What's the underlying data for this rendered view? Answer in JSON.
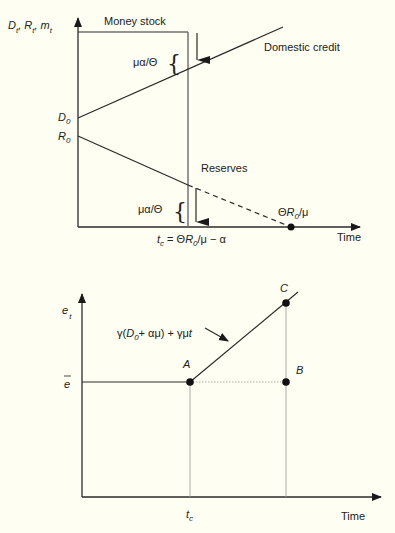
{
  "top_chart": {
    "y_axis_label": {
      "D": "D",
      "t1": "t",
      "R": "R",
      "t2": "t",
      "m": "m",
      "t3": "t",
      "sep": ","
    },
    "money_stock_label": "Money stock",
    "domestic_credit_label": "Domestic credit",
    "reserves_label": "Reserves",
    "jump_label_upper": "μα/Θ",
    "jump_label_lower": "μα/Θ",
    "d0_label": {
      "main": "D",
      "sub": "0"
    },
    "r0_label": {
      "main": "R",
      "sub": "0"
    },
    "exhaustion_label": {
      "pre": "Θ",
      "R": "R",
      "sub": "0",
      "post": "/μ"
    },
    "tc_label": {
      "t": "t",
      "c": "c",
      "eq": " = Θ",
      "R": "R",
      "sub": "0",
      "post": "/μ  − α"
    },
    "x_axis_label": "Time",
    "brace": "{"
  },
  "bottom_chart": {
    "y_axis_label": {
      "e": "e",
      "t": "t"
    },
    "ebar_label": "e",
    "formula_label": {
      "pre": "γ(",
      "D": "D",
      "sub": "0",
      "mid": "+ αμ) +  γμ",
      "t": "t"
    },
    "point_a": "A",
    "point_b": "B",
    "point_c": "C",
    "tc_label": {
      "t": "t",
      "c": "c"
    },
    "x_axis_label": "Time"
  }
}
